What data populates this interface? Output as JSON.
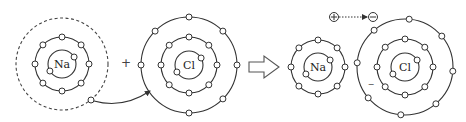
{
  "colors": {
    "stroke": "#333333",
    "background": "#ffffff"
  },
  "plus_operator": "+",
  "reaction_arrow": "hollow-right-arrow",
  "atoms": [
    {
      "id": "na-atom",
      "label": "Na",
      "state": "atom",
      "shells": [
        2,
        8,
        1
      ],
      "outer_shell_dashed": true
    },
    {
      "id": "cl-atom",
      "label": "Cl",
      "state": "atom",
      "shells": [
        2,
        8,
        7
      ]
    },
    {
      "id": "na-ion",
      "label": "Na",
      "state": "ion",
      "shells": [
        2,
        8
      ]
    },
    {
      "id": "cl-ion",
      "label": "Cl",
      "state": "ion",
      "shells": [
        2,
        8,
        8
      ],
      "charge_mark": "−"
    }
  ],
  "transfer": {
    "description": "One electron moves from Na outer shell to Cl outer shell",
    "legend_from_symbol": "⊕",
    "legend_to_symbol": "⊖"
  }
}
